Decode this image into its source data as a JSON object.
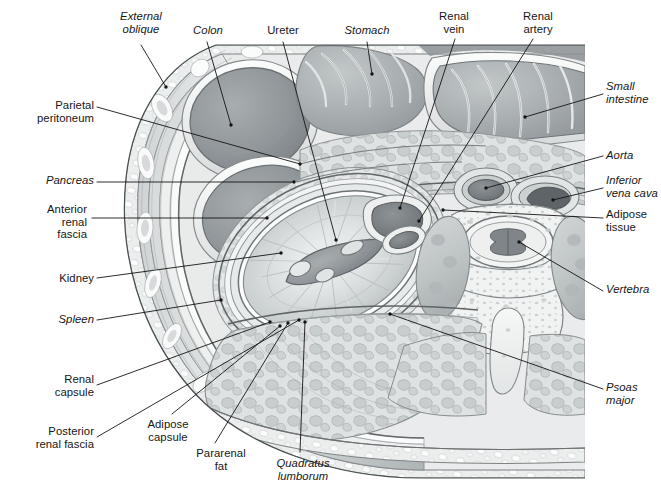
{
  "figure": {
    "kind": "anatomical-illustration",
    "background_color": "#ffffff",
    "ink_color": "#161616",
    "tissue_palette": {
      "skin_outline": "#6e6e6e",
      "muscle_mid": "#b9bcbd",
      "muscle_dark": "#8f9496",
      "lumen_dark": "#8d9294",
      "fat_light": "#e4e6e6",
      "bone_light": "#eceeee",
      "vessel_dark": "#7b8082",
      "kidney_fill": "#cdd1d2",
      "highlight": "#f6f7f7"
    }
  },
  "labels": [
    {
      "id": "external-oblique",
      "text": "External\noblique",
      "italic": true,
      "align": "center",
      "x": 108,
      "y": 10,
      "w": 66
    },
    {
      "id": "colon",
      "text": "Colon",
      "italic": true,
      "align": "center",
      "x": 184,
      "y": 24,
      "w": 48
    },
    {
      "id": "ureter",
      "text": "Ureter",
      "italic": false,
      "align": "center",
      "x": 258,
      "y": 24,
      "w": 50
    },
    {
      "id": "stomach",
      "text": "Stomach",
      "italic": true,
      "align": "center",
      "x": 336,
      "y": 24,
      "w": 62
    },
    {
      "id": "renal-vein",
      "text": "Renal\nvein",
      "italic": false,
      "align": "center",
      "x": 430,
      "y": 10,
      "w": 48
    },
    {
      "id": "renal-artery",
      "text": "Renal\nartery",
      "italic": false,
      "align": "center",
      "x": 512,
      "y": 10,
      "w": 52
    },
    {
      "id": "small-intestine",
      "text": "Small\nintestine",
      "italic": true,
      "align": "left",
      "x": 606,
      "y": 80,
      "w": 58
    },
    {
      "id": "parietal-peritoneum",
      "text": "Parietal\nperitoneum",
      "italic": false,
      "align": "right",
      "x": 8,
      "y": 99,
      "w": 86
    },
    {
      "id": "aorta",
      "text": "Aorta",
      "italic": true,
      "align": "left",
      "x": 606,
      "y": 149,
      "w": 50
    },
    {
      "id": "pancreas",
      "text": "Pancreas",
      "italic": true,
      "align": "right",
      "x": 8,
      "y": 174,
      "w": 86
    },
    {
      "id": "inferior-vena-cava",
      "text": "Inferior\nvena cava",
      "italic": true,
      "align": "left",
      "x": 606,
      "y": 174,
      "w": 60
    },
    {
      "id": "anterior-renal-fascia",
      "text": "Anterior\nrenal\nfascia",
      "italic": false,
      "align": "right",
      "x": 3,
      "y": 203,
      "w": 84
    },
    {
      "id": "adipose-tissue",
      "text": "Adipose\ntissue",
      "italic": false,
      "align": "left",
      "x": 606,
      "y": 208,
      "w": 56
    },
    {
      "id": "kidney",
      "text": "Kidney",
      "italic": false,
      "align": "right",
      "x": 8,
      "y": 272,
      "w": 86
    },
    {
      "id": "vertebra",
      "text": "Vertebra",
      "italic": true,
      "align": "left",
      "x": 606,
      "y": 283,
      "w": 56
    },
    {
      "id": "spleen",
      "text": "Spleen",
      "italic": true,
      "align": "right",
      "x": 8,
      "y": 313,
      "w": 86
    },
    {
      "id": "renal-capsule",
      "text": "Renal\ncapsule",
      "italic": false,
      "align": "right",
      "x": 8,
      "y": 373,
      "w": 86
    },
    {
      "id": "psoas-major",
      "text": "Psoas\nmajor",
      "italic": true,
      "align": "left",
      "x": 606,
      "y": 381,
      "w": 52
    },
    {
      "id": "posterior-renal-fascia",
      "text": "Posterior\nrenal fascia",
      "italic": false,
      "align": "right",
      "x": 3,
      "y": 425,
      "w": 91
    },
    {
      "id": "adipose-capsule",
      "text": "Adipose\ncapsule",
      "italic": false,
      "align": "center",
      "x": 137,
      "y": 418,
      "w": 62
    },
    {
      "id": "pararenal-fat",
      "text": "Pararenal\nfat",
      "italic": false,
      "align": "center",
      "x": 188,
      "y": 447,
      "w": 66
    },
    {
      "id": "quadratus-lumborum",
      "text": "Quadratus\nlumborum",
      "italic": true,
      "align": "center",
      "x": 263,
      "y": 457,
      "w": 80
    }
  ],
  "leaders": [
    {
      "id": "external-oblique",
      "path": "M141,45 L166,87"
    },
    {
      "id": "colon",
      "path": "M207,42 L231,125"
    },
    {
      "id": "ureter",
      "path": "M283,42 L336,240"
    },
    {
      "id": "stomach",
      "path": "M367,42 L372,74"
    },
    {
      "id": "renal-vein",
      "path": "M455,39 L400,208"
    },
    {
      "id": "renal-artery",
      "path": "M533,39 L419,221"
    },
    {
      "id": "small-intestine",
      "path": "M603,94 L525,117"
    },
    {
      "id": "parietal-peritoneum",
      "path": "M97,107 L300,164"
    },
    {
      "id": "aorta",
      "path": "M603,156 L486,188"
    },
    {
      "id": "pancreas",
      "path": "M97,182 L294,182"
    },
    {
      "id": "inferior-vena-cava",
      "path": "M603,188 L553,200"
    },
    {
      "id": "anterior-renal-fascia",
      "path": "M92,218 L267,218"
    },
    {
      "id": "adipose-tissue",
      "path": "M603,218 L443,210"
    },
    {
      "id": "kidney",
      "path": "M97,278 L281,253"
    },
    {
      "id": "vertebra",
      "path": "M603,291 L519,242"
    },
    {
      "id": "spleen",
      "path": "M97,320 L221,300"
    },
    {
      "id": "renal-capsule",
      "path": "M97,385 L270,322"
    },
    {
      "id": "psoas-major",
      "path": "M603,389 L390,314"
    },
    {
      "id": "posterior-renal-fascia",
      "path": "M97,437 L299,320"
    },
    {
      "id": "adipose-capsule",
      "path": "M172,414 L280,326"
    },
    {
      "id": "pararenal-fat",
      "path": "M215,443 L288,323"
    },
    {
      "id": "quadratus-lumborum",
      "path": "M300,452 L305,322"
    }
  ]
}
